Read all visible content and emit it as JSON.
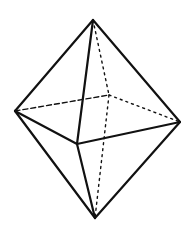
{
  "diagram": {
    "width": 194,
    "height": 231,
    "background": "#ffffff",
    "stroke_color": "#111111",
    "vertices": {
      "top": [
        93,
        20
      ],
      "left": [
        15,
        111
      ],
      "right": [
        180,
        122
      ],
      "front": [
        77,
        144
      ],
      "back": [
        109,
        95
      ],
      "bottom": [
        95,
        218
      ]
    },
    "edges": [
      {
        "from": "top",
        "to": "left",
        "style": "solid"
      },
      {
        "from": "top",
        "to": "right",
        "style": "solid"
      },
      {
        "from": "top",
        "to": "front",
        "style": "solid"
      },
      {
        "from": "left",
        "to": "front",
        "style": "solid"
      },
      {
        "from": "front",
        "to": "right",
        "style": "solid"
      },
      {
        "from": "left",
        "to": "bottom",
        "style": "solid"
      },
      {
        "from": "front",
        "to": "bottom",
        "style": "solid"
      },
      {
        "from": "right",
        "to": "bottom",
        "style": "solid"
      },
      {
        "from": "left",
        "to": "back",
        "style": "dashed"
      },
      {
        "from": "back",
        "to": "right",
        "style": "dotted"
      },
      {
        "from": "top",
        "to": "back",
        "style": "dotted"
      },
      {
        "from": "back",
        "to": "bottom",
        "style": "dotted"
      }
    ]
  }
}
